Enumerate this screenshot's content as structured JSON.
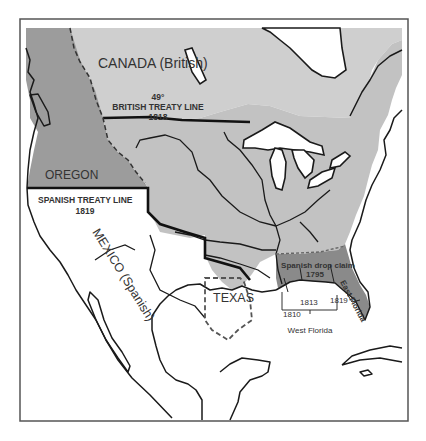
{
  "map": {
    "colors": {
      "background": "#ffffff",
      "frame": "#555555",
      "us_territory": "#c2c2c2",
      "canada": "#cfcfcf",
      "oregon": "#9c9c9c",
      "spanish_drop_claim": "#8a8a8a",
      "lake_water": "#ffffff",
      "coastline": "#1a1a1a"
    },
    "labels": {
      "canada": "CANADA (British)",
      "parallel": "49°",
      "british_treaty": "BRITISH  TREATY  LINE",
      "british_treaty_year": "1818",
      "oregon": "OREGON",
      "spanish_treaty": "SPANISH  TREATY  LINE",
      "spanish_treaty_year": "1819",
      "mexico": "MEXICO (Spanish)",
      "texas": "TEXAS",
      "spanish_drop_claim": "Spanish drop claim",
      "spanish_drop_claim_year": "1795",
      "east_florida": "East Florida",
      "west_florida": "West  Florida",
      "year_1810": "1810",
      "year_1813": "1813",
      "year_1819": "1819"
    }
  }
}
